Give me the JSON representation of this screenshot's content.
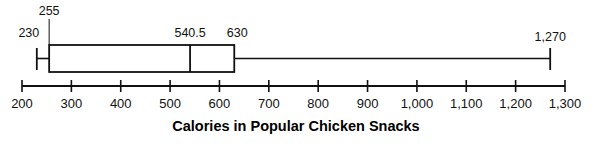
{
  "chart_data": {
    "type": "box",
    "title": "",
    "xlabel": "Calories in Popular Chicken Snacks",
    "ylabel": "",
    "xlim": [
      200,
      1300
    ],
    "grid": false,
    "legend": "none",
    "orientation": "horizontal",
    "tick_labels": [
      "200",
      "300",
      "400",
      "500",
      "600",
      "700",
      "800",
      "900",
      "1,000",
      "1,100",
      "1,200",
      "1,300"
    ],
    "tick_values": [
      200,
      300,
      400,
      500,
      600,
      700,
      800,
      900,
      1000,
      1100,
      1200,
      1300
    ],
    "boxes": [
      {
        "name": "Calories",
        "min": 230,
        "q1": 255,
        "median": 540.5,
        "q3": 630,
        "max": 1270,
        "labels": {
          "min": "230",
          "q1": "255",
          "median": "540.5",
          "q3": "630",
          "max": "1,270"
        }
      }
    ]
  },
  "axis": {
    "title": "Calories in Popular Chicken Snacks",
    "ticks": [
      {
        "value": 200,
        "label": "200"
      },
      {
        "value": 300,
        "label": "300"
      },
      {
        "value": 400,
        "label": "400"
      },
      {
        "value": 500,
        "label": "500"
      },
      {
        "value": 600,
        "label": "600"
      },
      {
        "value": 700,
        "label": "700"
      },
      {
        "value": 800,
        "label": "800"
      },
      {
        "value": 900,
        "label": "900"
      },
      {
        "value": 1000,
        "label": "1,000"
      },
      {
        "value": 1100,
        "label": "1,100"
      },
      {
        "value": 1200,
        "label": "1,200"
      },
      {
        "value": 1300,
        "label": "1,300"
      }
    ]
  },
  "annotations": {
    "min_label": "230",
    "q1_label": "255",
    "median_label": "540.5",
    "q3_label": "630",
    "max_label": "1,270"
  },
  "colors": {
    "stroke": "#111111",
    "background": "#ffffff",
    "text": "#000000"
  }
}
